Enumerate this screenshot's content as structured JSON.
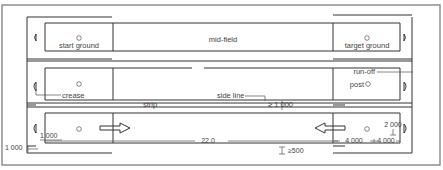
{
  "diagram": {
    "type": "pitch-layout-plan",
    "strips": [
      {
        "index": 1,
        "left_box_label": "start ground",
        "center_label": "mid-field",
        "right_box_label": "target ground"
      },
      {
        "index": 2,
        "left_annotation": "crease",
        "right_annotation_top": "run-off",
        "right_annotation_post": "post",
        "below_label": "side line",
        "strip_label": "strip",
        "clearance_label": "≥ 1 000"
      },
      {
        "index": 3,
        "arrow_left_direction": "right",
        "arrow_right_direction": "left",
        "length_label": "22.0",
        "left_dim_inner": "1 000",
        "left_dim_outer": "1 000",
        "right_dim_top": "2 000",
        "right_dim_a": "4 000",
        "right_dim_b": "4 000",
        "bottom_clearance": "≥500"
      }
    ],
    "colors": {
      "line": "#333333",
      "outer_border": "#888888",
      "background": "#ffffff"
    }
  }
}
